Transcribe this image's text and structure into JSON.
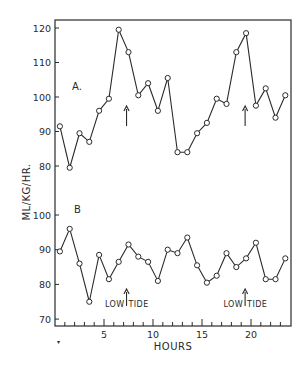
{
  "chart_data": [
    {
      "type": "line",
      "panel_label": "A.",
      "title": "",
      "xlabel": "HOURS",
      "ylabel": "ML/KG/HR.",
      "ylim": [
        78,
        122
      ],
      "y_ticks": [
        80,
        90,
        100,
        110,
        120
      ],
      "x": [
        0.5,
        1.5,
        2.5,
        3.5,
        4.5,
        5.5,
        6.5,
        7.5,
        8.5,
        9.5,
        10.5,
        11.5,
        12.5,
        13.5,
        14.5,
        15.5,
        16.5,
        17.5,
        18.5,
        19.5,
        20.5,
        21.5,
        22.5,
        23.5
      ],
      "values": [
        91.5,
        79.5,
        89.5,
        87,
        96,
        99.5,
        119.5,
        113,
        100.5,
        104,
        96,
        105.5,
        84,
        84,
        89.5,
        92.5,
        99.5,
        98,
        113,
        118.5,
        97.5,
        102.5,
        94,
        100.5
      ],
      "marker": "open-circle",
      "annotations": [
        {
          "type": "arrow-up",
          "x": 7.3,
          "text": ""
        },
        {
          "type": "arrow-up",
          "x": 19.4,
          "text": ""
        }
      ]
    },
    {
      "type": "line",
      "panel_label": "B",
      "title": "",
      "xlabel": "HOURS",
      "ylabel": "ML/KG/HR.",
      "ylim": [
        67,
        103
      ],
      "y_ticks": [
        70,
        80,
        90,
        100
      ],
      "x": [
        0.5,
        1.5,
        2.5,
        3.5,
        4.5,
        5.5,
        6.5,
        7.5,
        8.5,
        9.5,
        10.5,
        11.5,
        12.5,
        13.5,
        14.5,
        15.5,
        16.5,
        17.5,
        18.5,
        19.5,
        20.5,
        21.5,
        22.5,
        23.5
      ],
      "values": [
        89.5,
        96,
        86,
        75,
        88.5,
        81.5,
        86.5,
        91.5,
        88,
        86.5,
        81,
        90,
        89,
        93.5,
        85.5,
        80.5,
        82.5,
        89,
        85,
        87.5,
        92,
        81.5,
        81.5,
        87.5
      ],
      "marker": "open-circle",
      "annotations": [
        {
          "type": "arrow-up",
          "x": 7.3,
          "text": "LOW TIDE"
        },
        {
          "type": "arrow-up",
          "x": 19.4,
          "text": "LOW TIDE"
        }
      ]
    }
  ],
  "axes": {
    "x_range": [
      0,
      24
    ],
    "x_major_ticks": [
      5,
      10,
      15,
      20
    ],
    "x_minor_step": 1,
    "xlabel": "HOURS",
    "ylabel": "ML/KG/HR.",
    "grid": false,
    "legend": "none"
  },
  "labels": {
    "panel_a": "A.",
    "panel_b": "B",
    "low_tide_1": "LOW TIDE",
    "low_tide_2": "LOW TIDE",
    "xlabel": "HOURS",
    "ylabel": "ML/KG/HR."
  },
  "colors": {
    "ink": "#2a2a2a",
    "background": "#ffffff"
  }
}
